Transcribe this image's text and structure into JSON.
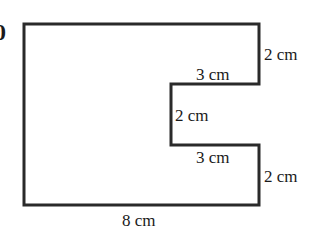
{
  "question_number_fragment": "0",
  "shape": {
    "description": "Rectilinear shape: 8cm-wide rectangle with a 3cm x 2cm rectangular notch cut from the right side",
    "stroke_color": "#2a2a2a",
    "fill_color": "#ffffff"
  },
  "labels": {
    "right_top": "2 cm",
    "notch_top": "3 cm",
    "notch_inner": "2 cm",
    "notch_bottom": "3 cm",
    "right_bottom": "2 cm",
    "bottom": "8 cm"
  }
}
